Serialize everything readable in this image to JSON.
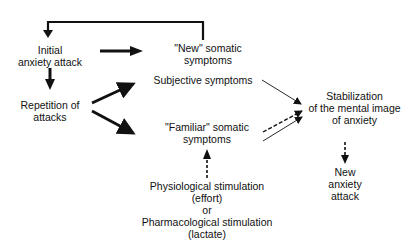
{
  "diagram": {
    "nodes": {
      "initial_attack": {
        "line1": "Initial",
        "line2": "anxiety attack"
      },
      "repetition": {
        "line1": "Repetition of",
        "line2": "attacks"
      },
      "new_somatic": {
        "line1": "\"New\" somatic",
        "line2": "symptoms"
      },
      "subjective": {
        "line1": "Subjective symptoms"
      },
      "familiar_somatic": {
        "line1": "\"Familiar\" somatic",
        "line2": "symptoms"
      },
      "stimulation": {
        "line1": "Physiological stimulation",
        "line2": "(effort)",
        "line3": "or",
        "line4": "Pharmacological stimulation",
        "line5": "(lactate)"
      },
      "stabilization": {
        "line1": "Stabilization",
        "line2": "of the mental image",
        "line3": "of anxiety"
      },
      "new_attack": {
        "line1": "New",
        "line2": "anxiety",
        "line3": "attack"
      }
    },
    "edges": [
      {
        "from": "new_somatic",
        "to": "initial_attack",
        "style": "thick-feedback"
      },
      {
        "from": "initial_attack",
        "to": "new_somatic",
        "style": "thick"
      },
      {
        "from": "initial_attack",
        "to": "repetition",
        "style": "thick"
      },
      {
        "from": "repetition",
        "to": "subjective",
        "style": "thick"
      },
      {
        "from": "repetition",
        "to": "familiar_somatic",
        "style": "thick"
      },
      {
        "from": "stimulation",
        "to": "familiar_somatic",
        "style": "dashed"
      },
      {
        "from": "subjective",
        "to": "stabilization",
        "style": "thin"
      },
      {
        "from": "familiar_somatic",
        "to": "stabilization",
        "style": "dashed"
      },
      {
        "from": "familiar_somatic",
        "to": "stabilization",
        "style": "thin"
      },
      {
        "from": "stabilization",
        "to": "new_attack",
        "style": "dashed"
      }
    ]
  }
}
